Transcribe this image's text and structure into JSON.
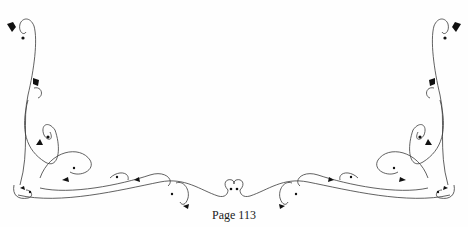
{
  "page": {
    "number_label": "Page 113"
  },
  "ornament": {
    "description": "decorative vine border with heart-shaped leaves",
    "color": "#111111"
  }
}
